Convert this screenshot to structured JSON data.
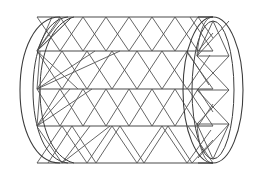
{
  "figure": {
    "title": "Triangulated cylindrical lattice (tube) wireframe",
    "background_color": "#ffffff",
    "line_color": "#3d3d3d",
    "mesh_color": "#555555",
    "stroke_width": "1",
    "canvas": {
      "width": 269,
      "height": 177
    }
  },
  "geometry": {
    "body": {
      "left_x": 37,
      "right_x": 213,
      "top_y": 17,
      "bottom_y": 163,
      "band_lines_y": [
        17,
        51,
        89,
        126,
        163
      ],
      "band_count": 4
    },
    "left_cap": {
      "center_x": 37,
      "center_y": 90,
      "rx_outer": 22,
      "ry_outer": 73,
      "rx_inner": 13,
      "ry_inner": 73,
      "arc_count": 2
    },
    "right_cap": {
      "center_x": 213,
      "center_y": 90,
      "rx_outer": 30,
      "ry_outer": 73,
      "rx_inner": 21,
      "ry_inner": 69,
      "cross_rows_y": [
        56,
        90,
        124
      ],
      "cross_left_x": 197,
      "cross_right_x": 229
    },
    "zigzag": {
      "band_1_peaks": 5,
      "band_2_peaks": 5,
      "band_3_peaks": 5,
      "band_4_peaks": 5,
      "pattern": "alternating up/down triangles crossing band boundaries"
    }
  }
}
